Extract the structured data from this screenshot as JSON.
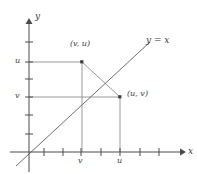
{
  "figure": {
    "type": "cartesian-diagram",
    "width": 197,
    "height": 174,
    "background": "#ffffff",
    "ink_color": "#555555",
    "label_color": "#3b3b3b",
    "axes": {
      "x_label": "x",
      "y_label": "y",
      "origin": {
        "x": 29,
        "y": 152
      },
      "x_axis": {
        "start_x": 10,
        "end_x": 182,
        "y": 152,
        "arrow": true
      },
      "y_axis": {
        "x": 29,
        "start_y": 18,
        "end_y": 172,
        "arrow": true
      },
      "x_ticks": [
        {
          "x": 44,
          "label": ""
        },
        {
          "x": 63,
          "label": ""
        },
        {
          "x": 81,
          "label": "v"
        },
        {
          "x": 101,
          "label": ""
        },
        {
          "x": 120,
          "label": "u"
        },
        {
          "x": 140,
          "label": ""
        },
        {
          "x": 159,
          "label": ""
        }
      ],
      "y_ticks": [
        {
          "y": 42,
          "label": ""
        },
        {
          "y": 62,
          "label": "u"
        },
        {
          "y": 79,
          "label": ""
        },
        {
          "y": 97,
          "label": "v"
        },
        {
          "y": 115,
          "label": ""
        },
        {
          "y": 134,
          "label": ""
        }
      ]
    },
    "identity_line": {
      "label": "y = x",
      "label_x": 146,
      "label_y": 40,
      "x1": 16,
      "y1": 166,
      "x2": 150,
      "y2": 42
    },
    "points": [
      {
        "name": "point-v-u",
        "label": "(v, u)",
        "x": 82,
        "y": 62,
        "label_x": 70,
        "label_y": 44
      },
      {
        "name": "point-u-v",
        "label": "(u, v)",
        "x": 120,
        "y": 97,
        "label_x": 127,
        "label_y": 93
      }
    ],
    "guide_lines": [
      {
        "name": "h-guide-u",
        "x1": 29,
        "y1": 62,
        "x2": 82,
        "y2": 62
      },
      {
        "name": "h-guide-v",
        "x1": 29,
        "y1": 97,
        "x2": 120,
        "y2": 97
      },
      {
        "name": "v-guide-v",
        "x1": 82,
        "y1": 62,
        "x2": 82,
        "y2": 152
      },
      {
        "name": "v-guide-u",
        "x1": 120,
        "y1": 97,
        "x2": 120,
        "y2": 152
      },
      {
        "name": "connector",
        "x1": 82,
        "y1": 62,
        "x2": 120,
        "y2": 97
      }
    ]
  }
}
